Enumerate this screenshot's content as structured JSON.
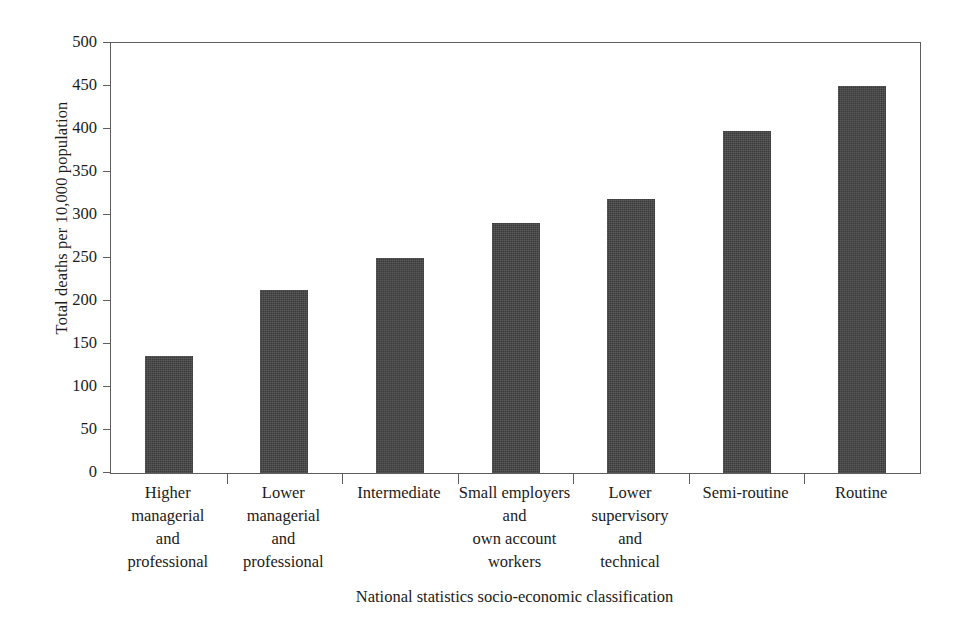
{
  "chart_data": {
    "type": "bar",
    "title": "",
    "xlabel": "National statistics socio-economic classification",
    "ylabel": "Total deaths per 10,000 population",
    "ylim": [
      0,
      500
    ],
    "ytick_step": 50,
    "grid": false,
    "legend": null,
    "bar_color": "#3b3b3b",
    "axis_color": "#5d5d5d",
    "categories": [
      "Higher\nmanagerial\nand\nprofessional",
      "Lower\nmanagerial\nand\nprofessional",
      "Intermediate",
      "Small employers\nand\nown account\nworkers",
      "Lower\nsupervisory\nand\ntechnical",
      "Semi-routine",
      "Routine"
    ],
    "category_lines": [
      [
        "Higher",
        "managerial",
        "and",
        "professional"
      ],
      [
        "Lower",
        "managerial",
        "and",
        "professional"
      ],
      [
        "Intermediate"
      ],
      [
        "Small employers",
        "and",
        "own account",
        "workers"
      ],
      [
        "Lower",
        "supervisory",
        "and",
        "technical"
      ],
      [
        "Semi-routine"
      ],
      [
        "Routine"
      ]
    ],
    "values": [
      136,
      213,
      250,
      291,
      319,
      398,
      450
    ],
    "ytick_labels": [
      "0",
      "50",
      "100",
      "150",
      "200",
      "250",
      "300",
      "350",
      "400",
      "450",
      "500"
    ],
    "ytick_values": [
      0,
      50,
      100,
      150,
      200,
      250,
      300,
      350,
      400,
      450,
      500
    ]
  }
}
